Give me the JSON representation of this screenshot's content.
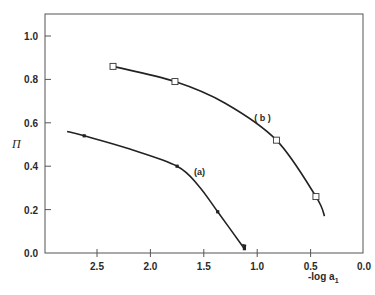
{
  "chart_data": {
    "type": "line",
    "title": "",
    "xlabel": "-log a",
    "xlabel_subscript": "1",
    "ylabel": "Π",
    "xlim": [
      2.85,
      0.0
    ],
    "ylim": [
      0.0,
      1.1
    ],
    "x_reversed": true,
    "xticks": [
      2.5,
      2.0,
      1.5,
      1.0,
      0.5,
      0.0
    ],
    "xtick_labels": [
      "2.5",
      "2.0",
      "1.5",
      "1.0",
      "0.5",
      "0.0"
    ],
    "yticks": [
      0.0,
      0.2,
      0.4,
      0.6,
      0.8,
      1.0
    ],
    "ytick_labels": [
      "0.0",
      "0.2",
      "0.4",
      "0.6",
      "0.8",
      "1.0"
    ],
    "grid": false,
    "legend": "none (inline curve labels)",
    "series": [
      {
        "name": "(b)",
        "marker": "open-square",
        "points": [
          {
            "x": 2.35,
            "y": 0.86
          },
          {
            "x": 1.77,
            "y": 0.79
          },
          {
            "x": 0.82,
            "y": 0.52
          },
          {
            "x": 0.45,
            "y": 0.26
          }
        ],
        "curve": [
          {
            "x": 2.35,
            "y": 0.86
          },
          {
            "x": 1.77,
            "y": 0.79
          },
          {
            "x": 1.3,
            "y": 0.69
          },
          {
            "x": 0.82,
            "y": 0.52
          },
          {
            "x": 0.45,
            "y": 0.26
          },
          {
            "x": 0.37,
            "y": 0.17
          }
        ]
      },
      {
        "name": "(a)",
        "marker": "small-filled",
        "points": [
          {
            "x": 2.62,
            "y": 0.54
          },
          {
            "x": 1.75,
            "y": 0.4
          },
          {
            "x": 1.37,
            "y": 0.19
          },
          {
            "x": 1.12,
            "y": 0.02
          }
        ],
        "curve": [
          {
            "x": 2.78,
            "y": 0.56
          },
          {
            "x": 2.62,
            "y": 0.54
          },
          {
            "x": 2.2,
            "y": 0.48
          },
          {
            "x": 1.75,
            "y": 0.4
          },
          {
            "x": 1.55,
            "y": 0.31
          },
          {
            "x": 1.37,
            "y": 0.19
          },
          {
            "x": 1.12,
            "y": 0.02
          }
        ]
      }
    ],
    "annotations": [
      {
        "text": "( b )",
        "x": 0.95,
        "y": 0.61
      },
      {
        "text": "(a)",
        "x": 1.54,
        "y": 0.36
      }
    ]
  }
}
